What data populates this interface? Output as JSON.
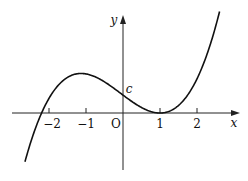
{
  "chart_data": {
    "type": "line",
    "title": "",
    "xlabel": "x",
    "ylabel": "y",
    "origin_label": "O",
    "x_ticks": [
      "-2",
      "-1",
      "1",
      "2"
    ],
    "annotations": [
      {
        "text": "c",
        "meaning": "y-intercept"
      }
    ],
    "series": [
      {
        "name": "cubic curve",
        "description": "Cubic with local maximum near x=-1, y-intercept c, double root (touching x-axis) at x=1, single root near x=-2.2",
        "x": [
          -2.6,
          -2.2,
          -2,
          -1.5,
          -1,
          -0.5,
          0,
          0.5,
          1,
          1.5,
          2,
          2.5
        ],
        "y": [
          -0.35,
          0,
          0.16,
          0.66,
          1.06,
          0.9,
          0.48,
          0.15,
          0,
          0.2,
          0.92,
          2.33
        ]
      }
    ],
    "xlim": [
      -3,
      3
    ],
    "ylim": [
      -1.5,
      3
    ],
    "grid": false,
    "legend": "none"
  },
  "labels": {
    "x_axis": "x",
    "y_axis": "y",
    "origin": "O",
    "intercept": "c",
    "tick_m2": "−2",
    "tick_m1": "−1",
    "tick_1": "1",
    "tick_2": "2"
  },
  "colors": {
    "line": "#111111",
    "axis": "#222222",
    "background": "#ffffff"
  }
}
